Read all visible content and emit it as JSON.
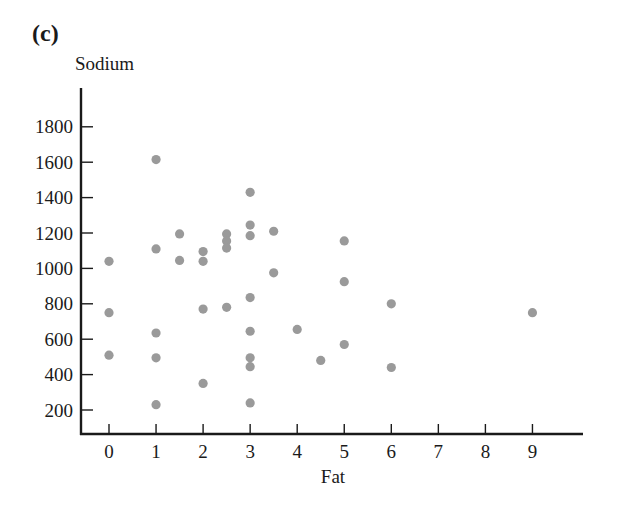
{
  "figure": {
    "panel_label": "(c)",
    "ylabel": "Sodium",
    "xlabel": "Fat"
  },
  "colors": {
    "point": "#9a9a9a",
    "axis": "#1a1a1a",
    "background": "#ffffff"
  },
  "chart_data": {
    "type": "scatter",
    "title": "(c)",
    "xlabel": "Fat",
    "ylabel": "Sodium",
    "xlim": [
      -0.6,
      10
    ],
    "ylim": [
      70,
      2050
    ],
    "grid": false,
    "legend": null,
    "x_ticks": [
      0,
      1,
      2,
      3,
      4,
      5,
      6,
      7,
      8,
      9
    ],
    "y_ticks": [
      200,
      400,
      600,
      800,
      1000,
      1200,
      1400,
      1600,
      1800
    ],
    "points": [
      {
        "x": 0,
        "y": 1040
      },
      {
        "x": 0,
        "y": 750
      },
      {
        "x": 0,
        "y": 510
      },
      {
        "x": 1,
        "y": 1615
      },
      {
        "x": 1,
        "y": 1110
      },
      {
        "x": 1,
        "y": 635
      },
      {
        "x": 1,
        "y": 495
      },
      {
        "x": 1,
        "y": 230
      },
      {
        "x": 1.5,
        "y": 1195
      },
      {
        "x": 1.5,
        "y": 1045
      },
      {
        "x": 2,
        "y": 1095
      },
      {
        "x": 2,
        "y": 1040
      },
      {
        "x": 2,
        "y": 770
      },
      {
        "x": 2,
        "y": 350
      },
      {
        "x": 2.5,
        "y": 1195
      },
      {
        "x": 2.5,
        "y": 1155
      },
      {
        "x": 2.5,
        "y": 1115
      },
      {
        "x": 2.5,
        "y": 780
      },
      {
        "x": 3,
        "y": 1430
      },
      {
        "x": 3,
        "y": 1245
      },
      {
        "x": 3,
        "y": 1185
      },
      {
        "x": 3,
        "y": 835
      },
      {
        "x": 3,
        "y": 645
      },
      {
        "x": 3,
        "y": 495
      },
      {
        "x": 3,
        "y": 445
      },
      {
        "x": 3,
        "y": 240
      },
      {
        "x": 3.5,
        "y": 1210
      },
      {
        "x": 3.5,
        "y": 975
      },
      {
        "x": 4,
        "y": 655
      },
      {
        "x": 4.5,
        "y": 480
      },
      {
        "x": 5,
        "y": 1155
      },
      {
        "x": 5,
        "y": 925
      },
      {
        "x": 5,
        "y": 570
      },
      {
        "x": 6,
        "y": 800
      },
      {
        "x": 6,
        "y": 440
      },
      {
        "x": 9,
        "y": 750
      }
    ]
  }
}
